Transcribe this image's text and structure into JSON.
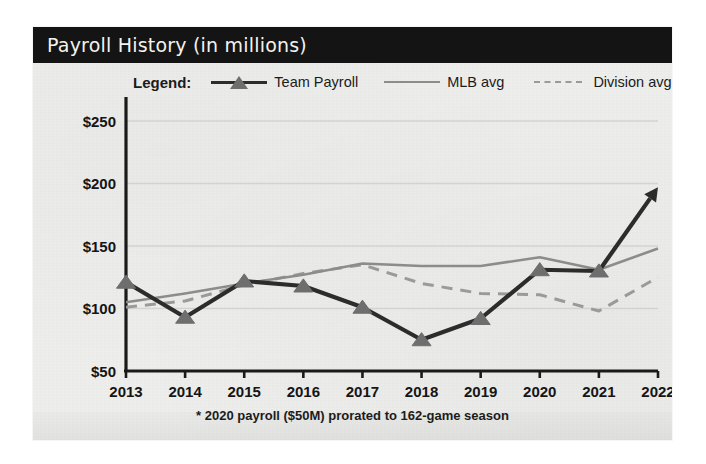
{
  "card": {
    "title": "Payroll History (in millions)",
    "footnote": "* 2020 payroll ($50M) prorated to 162-game season"
  },
  "legend": {
    "title": "Legend:",
    "entries": [
      {
        "label": "Team Payroll",
        "style": "line-marker",
        "color": "#2c2c2c"
      },
      {
        "label": "MLB avg",
        "style": "solid",
        "color": "#8c8c8c"
      },
      {
        "label": "Division avg",
        "style": "dashed",
        "color": "#9a9a9a"
      }
    ]
  },
  "colors": {
    "header_bg": "#141414",
    "header_text": "#f2f2f0",
    "paper": "#eeeeec",
    "team": "#2c2c2c",
    "team_marker": "#6e6e6e",
    "mlb": "#8c8c8c",
    "division": "#9a9a9a",
    "grid": "#d3d3d1",
    "axis": "#1a1a1a"
  },
  "chart_data": {
    "type": "line",
    "title": "Payroll History (in millions)",
    "xlabel": "",
    "ylabel": "",
    "x": [
      2013,
      2014,
      2015,
      2016,
      2017,
      2018,
      2019,
      2020,
      2021,
      2022
    ],
    "categories": [
      "2013",
      "2014",
      "2015",
      "2016",
      "2017",
      "2018",
      "2019",
      "2020",
      "2021",
      "2022"
    ],
    "ylim": [
      50,
      250
    ],
    "yticks": [
      50,
      100,
      150,
      200,
      250
    ],
    "ytick_labels": [
      "$50",
      "$100",
      "$150",
      "$200",
      "$250"
    ],
    "grid": true,
    "legend_position": "top",
    "annotations": [
      "* 2020 payroll ($50M) prorated to 162-game season"
    ],
    "series": [
      {
        "name": "Team Payroll",
        "color": "#2c2c2c",
        "marker": "triangle",
        "values": [
          121,
          93,
          122,
          118,
          101,
          75,
          92,
          131,
          130,
          197
        ]
      },
      {
        "name": "MLB avg",
        "color": "#8c8c8c",
        "marker": "none",
        "values": [
          105,
          112,
          120,
          127,
          136,
          134,
          134,
          141,
          131,
          148
        ]
      },
      {
        "name": "Division avg",
        "color": "#9a9a9a",
        "marker": "none",
        "values": [
          101,
          106,
          119,
          128,
          135,
          120,
          112,
          111,
          98,
          125
        ]
      }
    ]
  }
}
